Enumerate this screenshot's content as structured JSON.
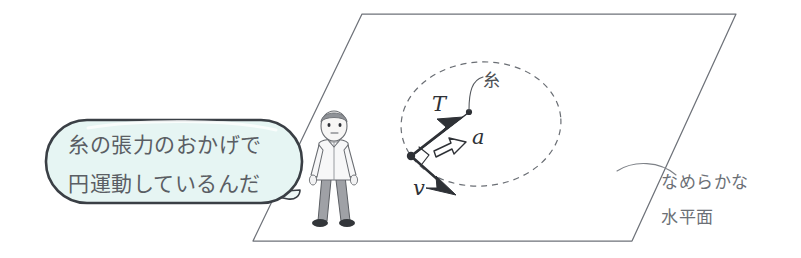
{
  "illustration": {
    "title": "糸の張力による等速円運動の図",
    "speech_bubble": {
      "line1": "糸の張力のおかげで",
      "line2": "円運動しているんだ",
      "fill_color": "#e3f4f2",
      "outline_color": "#3a3f45"
    },
    "plane": {
      "label_line1": "なめらかな",
      "label_line2": "水平面",
      "outline_color": "#6e7279"
    },
    "thread": {
      "label": "糸",
      "color": "#4c5054"
    },
    "vectors": [
      {
        "name": "tension",
        "label": "T",
        "style": "solid-arrow",
        "color": "#2e3136"
      },
      {
        "name": "acceleration",
        "label": "a",
        "style": "hollow-arrow",
        "color": "#2e3136"
      },
      {
        "name": "velocity",
        "label": "v",
        "style": "solid-arrow",
        "color": "#2e3136"
      }
    ],
    "orbit": {
      "name": "circular-path",
      "style": "dashed-ellipse",
      "color": "#6a6e74"
    },
    "person": {
      "name": "observer",
      "shirt_color": "#f4f4f4",
      "trouser_color": "#9a9ca1",
      "hair_color": "#8f9297"
    }
  }
}
